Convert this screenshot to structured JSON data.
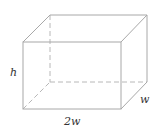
{
  "diagram": {
    "type": "rectangular-prism",
    "labels": {
      "height": "h",
      "length": "2w",
      "depth": "w"
    },
    "colors": {
      "edge": "#a8a8a8",
      "hidden_edge": "#b8b8b8",
      "label": "#333333"
    }
  }
}
